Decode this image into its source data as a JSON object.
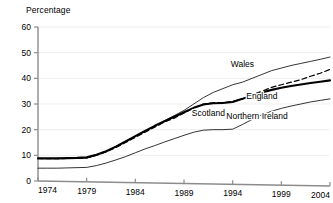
{
  "chart_data": {
    "type": "line",
    "title": "",
    "subtitle": "",
    "ylabel": "Percentage",
    "xlabel": "",
    "ylim": [
      0,
      60
    ],
    "xlim": [
      1974,
      2004
    ],
    "yticks": [
      "0",
      "10",
      "20",
      "30",
      "40",
      "50",
      "60"
    ],
    "xticks": [
      "1974",
      "1979",
      "1984",
      "1989",
      "1994",
      "1999",
      "2004"
    ],
    "grid": true,
    "legend_position": "inline-annotations",
    "x": [
      1974,
      1975,
      1976,
      1977,
      1978,
      1979,
      1980,
      1981,
      1982,
      1983,
      1984,
      1985,
      1986,
      1987,
      1988,
      1989,
      1990,
      1991,
      1992,
      1993,
      1994,
      1995,
      1996,
      1997,
      1998,
      1999,
      2000,
      2001,
      2002,
      2003,
      2004
    ],
    "series": [
      {
        "name": "Wales",
        "style": "thin-solid",
        "color": "#000000",
        "values": [
          8.8,
          8.8,
          8.8,
          8.8,
          8.8,
          9.0,
          10.0,
          11.5,
          13.5,
          15.5,
          17.5,
          19.5,
          21.5,
          23.5,
          25.5,
          27.5,
          30.0,
          32.5,
          34.5,
          36.0,
          37.5,
          38.5,
          40.0,
          41.5,
          43.0,
          44.0,
          45.0,
          45.8,
          46.6,
          47.4,
          48.3
        ]
      },
      {
        "name": "Scotland",
        "style": "dashed",
        "color": "#000000",
        "values": [
          8.8,
          8.7,
          8.7,
          8.8,
          8.9,
          9.0,
          10.0,
          11.3,
          13.0,
          15.0,
          17.0,
          19.0,
          21.0,
          23.0,
          24.5,
          26.5,
          28.5,
          30.0,
          30.5,
          30.5,
          31.0,
          32.0,
          33.5,
          35.0,
          36.5,
          37.5,
          38.5,
          39.5,
          40.8,
          42.0,
          43.5
        ]
      },
      {
        "name": "England",
        "style": "thick-solid",
        "color": "#000000",
        "values": [
          8.8,
          8.8,
          8.8,
          8.9,
          9.0,
          9.2,
          10.2,
          11.6,
          13.4,
          15.4,
          17.5,
          19.5,
          21.5,
          23.3,
          25.0,
          26.8,
          28.5,
          29.8,
          30.3,
          30.4,
          30.8,
          32.0,
          33.3,
          34.5,
          35.5,
          36.3,
          37.0,
          37.6,
          38.2,
          38.7,
          39.2
        ]
      },
      {
        "name": "Northern Ireland",
        "style": "thin-solid",
        "color": "#000000",
        "values": [
          5.0,
          5.0,
          5.0,
          5.1,
          5.2,
          5.3,
          6.0,
          7.0,
          8.2,
          9.5,
          11.0,
          12.5,
          13.8,
          15.2,
          16.5,
          17.8,
          19.0,
          19.8,
          20.0,
          20.0,
          20.2,
          22.0,
          24.0,
          25.8,
          27.2,
          28.3,
          29.2,
          30.0,
          30.8,
          31.4,
          32.0
        ]
      }
    ],
    "annotations": [
      {
        "text": "Wales",
        "x": 1995.0,
        "y": 44.5
      },
      {
        "text": "Scotland",
        "x": 1991.5,
        "y": 25.5
      },
      {
        "text": "England",
        "x": 1997.0,
        "y": 32.0
      },
      {
        "text": "Northern Ireland",
        "x": 1996.5,
        "y": 24.0
      }
    ]
  }
}
